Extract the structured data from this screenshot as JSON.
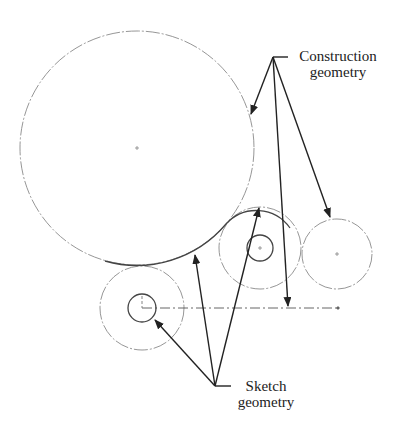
{
  "labels": {
    "construction": {
      "line1": "Construction",
      "line2": "geometry"
    },
    "sketch": {
      "line1": "Sketch",
      "line2": "geometry"
    }
  },
  "colors": {
    "construction": "#8a8a8a",
    "sketch": "#444444",
    "arrow": "#222222",
    "text": "#222222"
  },
  "geometry": {
    "construction_circles": [
      {
        "id": "large-circle",
        "cx": 137,
        "cy": 148,
        "r": 117
      },
      {
        "id": "middle-outer-circle",
        "cx": 260,
        "cy": 248,
        "r": 41
      },
      {
        "id": "right-circle",
        "cx": 337,
        "cy": 254,
        "r": 35
      },
      {
        "id": "bottom-left-outer-circle",
        "cx": 142,
        "cy": 308,
        "r": 42
      }
    ],
    "sketch_circles": [
      {
        "id": "middle-inner-circle",
        "cx": 260,
        "cy": 248,
        "r": 13
      },
      {
        "id": "bottom-left-inner-circle",
        "cx": 142,
        "cy": 308,
        "r": 14
      }
    ],
    "centerline": {
      "x1": 142,
      "y1": 308,
      "x2": 338,
      "y2": 308
    }
  }
}
